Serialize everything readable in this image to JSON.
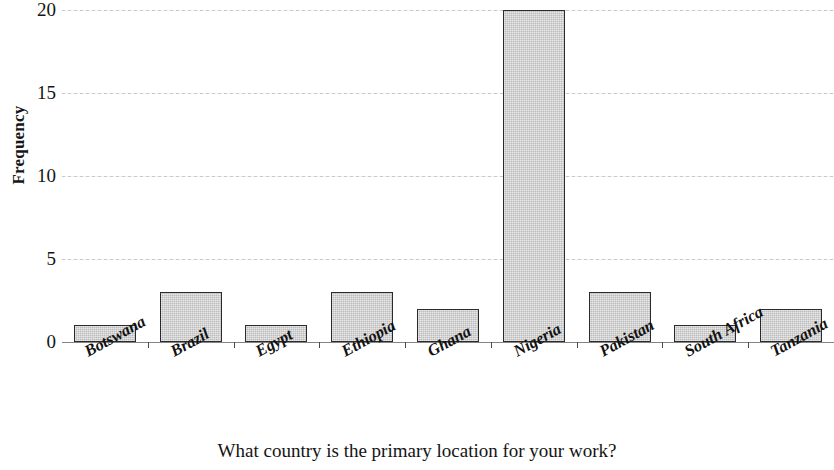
{
  "chart_data": {
    "type": "bar",
    "title": "",
    "xlabel": "What country is the primary location for your work?",
    "ylabel": "Frequency",
    "categories": [
      "Botswana",
      "Brazil",
      "Egypt",
      "Ethiopia",
      "Ghana",
      "Nigeria",
      "Pakistan",
      "South Africa",
      "Tanzania"
    ],
    "values": [
      1,
      3,
      1,
      3,
      2,
      20,
      3,
      1,
      2
    ],
    "ylim": [
      0,
      20
    ],
    "yticks": [
      0,
      5,
      10,
      15,
      20
    ],
    "ytick_labels": [
      "0",
      "5",
      "10",
      "15",
      "20"
    ],
    "grid": true,
    "grid_axis": "y",
    "legend": false,
    "bar_fill_color": "#c9c9c9",
    "bar_edge_color": "#2b2b2b",
    "gridline_color": "#bfbfbf",
    "axis_color": "#7d7d7d",
    "text_color": "#141414"
  }
}
